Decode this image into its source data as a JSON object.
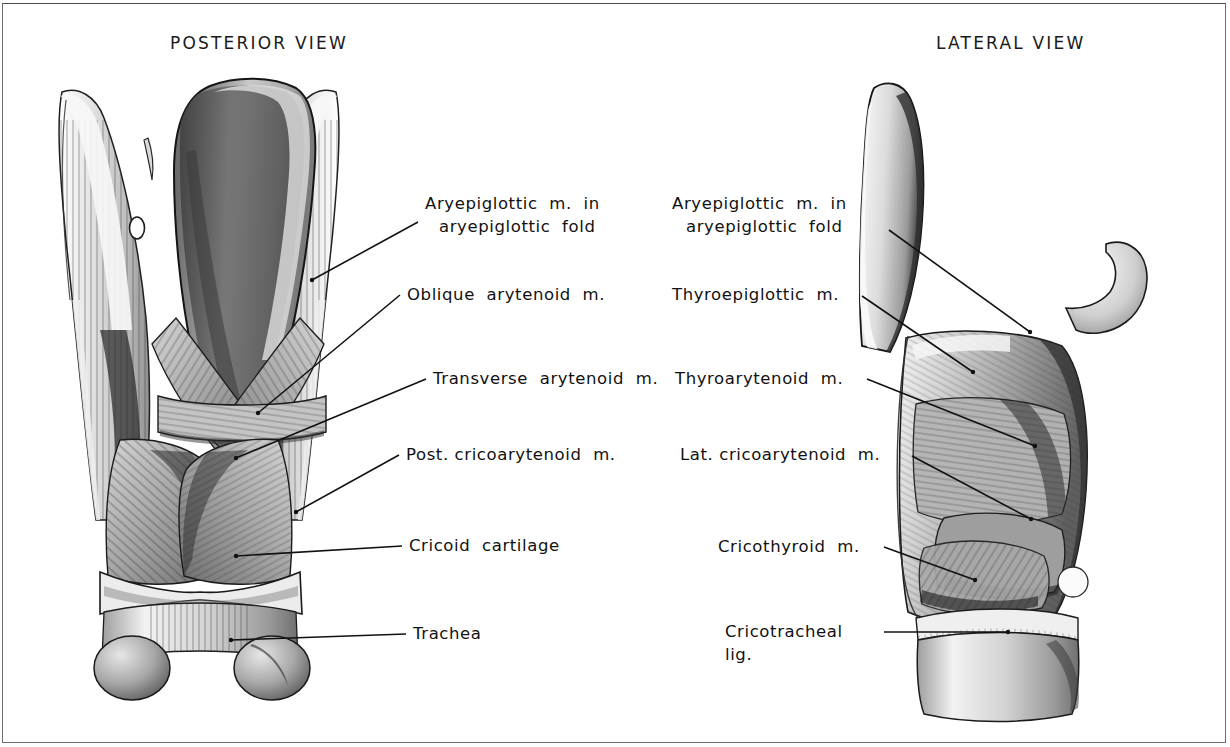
{
  "plate": {
    "width": 1230,
    "height": 747,
    "background": "#ffffff",
    "ink": "#111111",
    "border_color": "#6e6e6e",
    "subject": "Intrinsic muscles of the larynx"
  },
  "views": {
    "posterior": {
      "title": "POSTERIOR  VIEW"
    },
    "lateral": {
      "title": "LATERAL  VIEW"
    }
  },
  "labels": {
    "posterior": [
      {
        "line1": "Aryepiglottic  m.  in",
        "line2": "aryepiglottic  fold"
      },
      {
        "line1": "Oblique  arytenoid  m.",
        "line2": ""
      },
      {
        "line1": "Transverse  arytenoid  m.",
        "line2": ""
      },
      {
        "line1": "Post. cricoarytenoid  m.",
        "line2": ""
      },
      {
        "line1": "Cricoid  cartilage",
        "line2": ""
      },
      {
        "line1": "Trachea",
        "line2": ""
      }
    ],
    "lateral": [
      {
        "line1": "Aryepiglottic  m.  in",
        "line2": "aryepiglottic  fold"
      },
      {
        "line1": "Thyroepiglottic  m.",
        "line2": ""
      },
      {
        "line1": "Thyroarytenoid  m.",
        "line2": ""
      },
      {
        "line1": "Lat. cricoarytenoid  m.",
        "line2": ""
      },
      {
        "line1": "Cricothyroid  m.",
        "line2": ""
      },
      {
        "line1": "Cricotracheal",
        "line2": "lig."
      }
    ]
  }
}
